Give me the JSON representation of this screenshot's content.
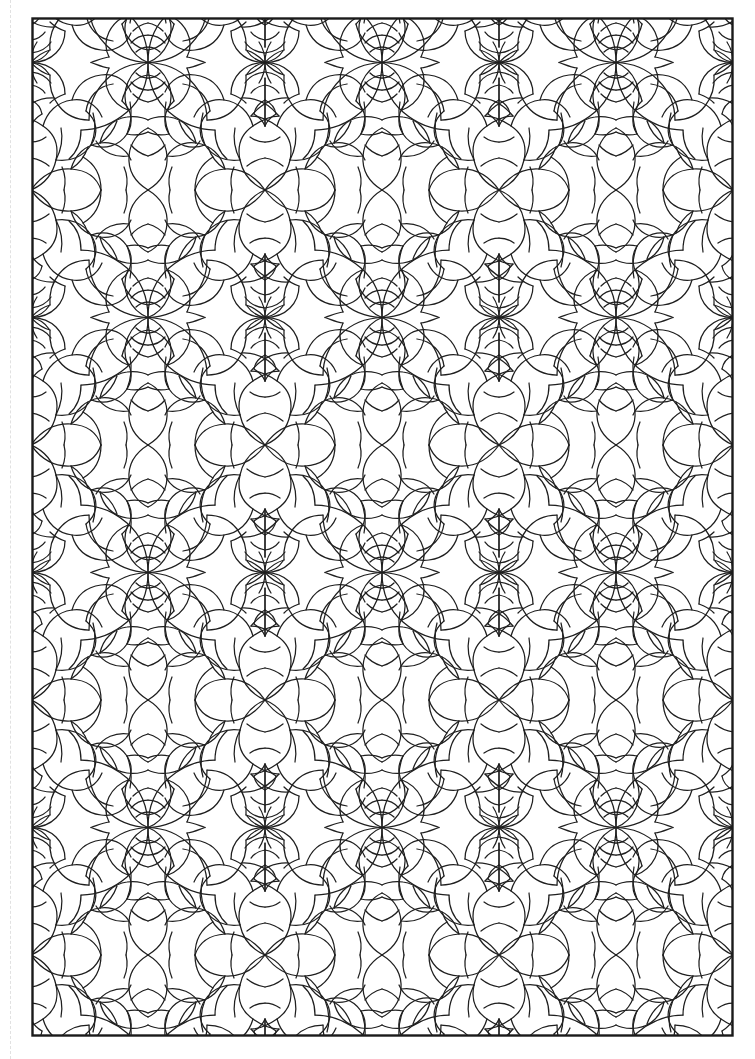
{
  "page": {
    "kind": "coloring-book-page",
    "background_color": "#ffffff",
    "width": 755,
    "height": 1059
  },
  "cut_line": {
    "name": "trim-guide",
    "style": "dashed",
    "color": "#dcdcdc",
    "x": 10
  },
  "artwork": {
    "title": "",
    "caption": "",
    "frame": {
      "x": 31,
      "y": 17,
      "width": 703,
      "height": 1020,
      "stroke_color": "#1a1a1a",
      "stroke_width": 2,
      "fill": "#ffffff"
    },
    "line_color": "#1f1f1f",
    "line_width": 1.25,
    "pattern": {
      "type": "symmetric-tessellation",
      "description": "Interlocking curved petal and pinwheel tessellation with vertical and horizontal mirror symmetry",
      "tile_width": 234,
      "tile_height": 255,
      "columns": 3,
      "rows": 4,
      "motifs": [
        "pinwheel-triangle",
        "petal-oval",
        "bowtie-eye",
        "lotus-crown",
        "arc-lattice"
      ]
    }
  }
}
